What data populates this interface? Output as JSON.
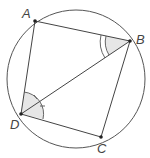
{
  "diagram": {
    "circle": {
      "cx": 76,
      "cy": 79,
      "r": 69,
      "stroke": "#555555"
    },
    "points": {
      "A": {
        "x": 35,
        "y": 21,
        "label": "A",
        "lx": 22,
        "ly": 18
      },
      "B": {
        "x": 130,
        "y": 41,
        "label": "B",
        "lx": 136,
        "ly": 44
      },
      "C": {
        "x": 101,
        "y": 137,
        "label": "C",
        "lx": 98,
        "ly": 153
      },
      "D": {
        "x": 21,
        "y": 114,
        "label": "D",
        "lx": 10,
        "ly": 129
      }
    },
    "segments": [
      "AB",
      "BC",
      "CD",
      "DA",
      "BD"
    ],
    "angle_marks": [
      {
        "vertex": "B",
        "between": [
          "A",
          "D"
        ],
        "arcs": 2,
        "shaded": true
      },
      {
        "vertex": "D",
        "between": [
          "A",
          "B"
        ],
        "arcs": 1,
        "ticks": 1,
        "shaded": true
      },
      {
        "vertex": "D",
        "between": [
          "B",
          "C"
        ],
        "arcs": 1,
        "ticks": 1,
        "shaded": true
      }
    ],
    "colors": {
      "line": "#444444",
      "shade": "#e6e6e6",
      "point": "#222222"
    }
  }
}
